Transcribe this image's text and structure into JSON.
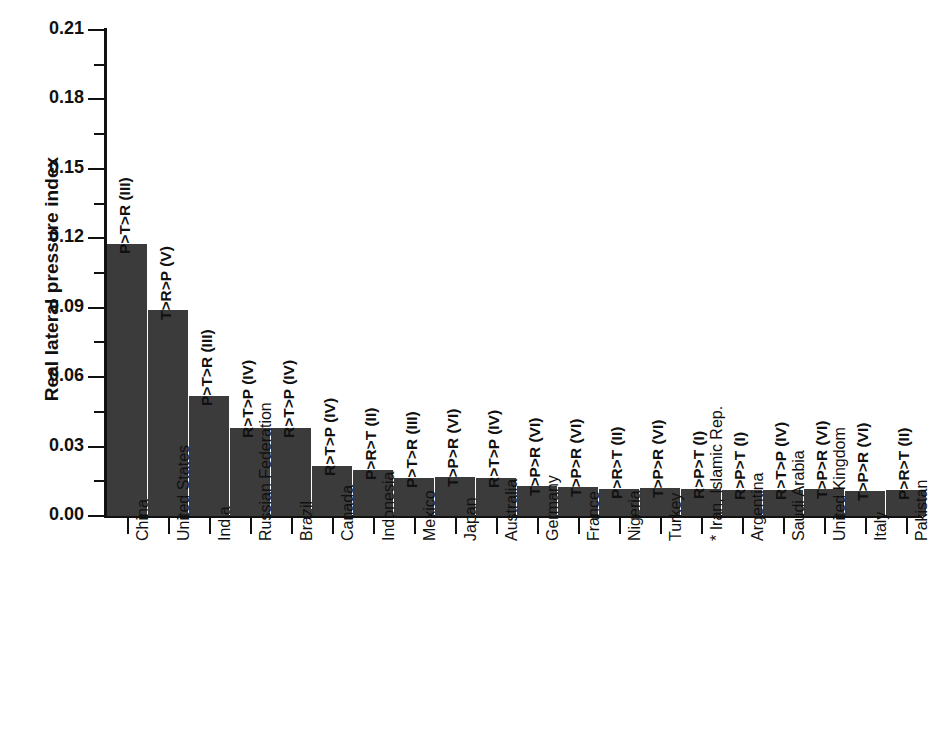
{
  "chart_data": {
    "type": "bar",
    "title": "",
    "xlabel": "",
    "ylabel": "Real lateral pressure index",
    "ylim": [
      0.0,
      0.21
    ],
    "ytick_labels": [
      "0.00",
      "0.03",
      "0.06",
      "0.09",
      "0.12",
      "0.15",
      "0.18",
      "0.21"
    ],
    "ytick_values": [
      0.0,
      0.03,
      0.06,
      0.09,
      0.12,
      0.15,
      0.18,
      0.21
    ],
    "minor_ticks": true,
    "grid": false,
    "legend": "none",
    "categories": [
      "China",
      "United States",
      "India",
      "Russian Federation",
      "Brazil",
      "Canada",
      "Indonesia",
      "Mexico",
      "Japan",
      "Australia",
      "Germany",
      "France",
      "Nigeria",
      "Turkey",
      "* Iran, Islamic Rep.",
      "Argentina",
      "Saudi Arabia",
      "United Kingdom",
      "Italy",
      "Pakistan"
    ],
    "values": [
      0.1175,
      0.089,
      0.052,
      0.038,
      0.038,
      0.0215,
      0.02,
      0.0165,
      0.017,
      0.0165,
      0.0128,
      0.0125,
      0.0118,
      0.012,
      0.0115,
      0.0112,
      0.0112,
      0.0115,
      0.011,
      0.0112
    ],
    "bar_annotations": [
      "P>T>R (III)",
      "T>R>P (V)",
      "P>T>R (III)",
      "R>T>P (IV)",
      "R>T>P (IV)",
      "R>T>P (IV)",
      "P>R>T (II)",
      "P>T>R (III)",
      "T>P>R (VI)",
      "R>T>P (IV)",
      "T>P>R (VI)",
      "T>P>R (VI)",
      "P>R>T (II)",
      "T>P>R (VI)",
      "R>P>T (I)",
      "R>P>T (I)",
      "R>T>P (IV)",
      "T>P>R (VI)",
      "T>P>R (VI)",
      "P>R>T (II)"
    ],
    "bar_color": "#3b3b3b",
    "axis_color": "#111111",
    "background_color": "#ffffff"
  }
}
